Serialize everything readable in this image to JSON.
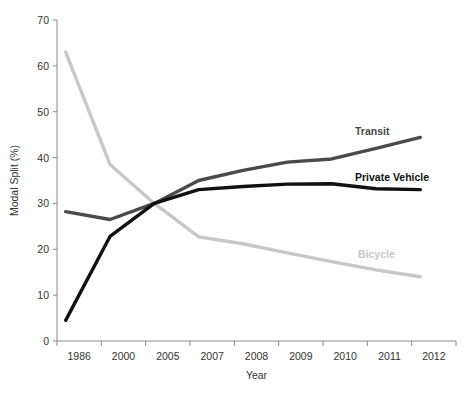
{
  "chart_data": {
    "type": "line",
    "title": "",
    "xlabel": "Year",
    "ylabel": "Modal Split (%)",
    "categories": [
      "1986",
      "2000",
      "2005",
      "2007",
      "2008",
      "2009",
      "2010",
      "2011",
      "2012"
    ],
    "ylim": [
      0,
      70
    ],
    "yticks": [
      0,
      10,
      20,
      30,
      40,
      50,
      60,
      70
    ],
    "grid": false,
    "legend_position": "inline-right",
    "series": [
      {
        "name": "Transit",
        "color": "#4a4a4a",
        "values": [
          28.2,
          26.5,
          30.0,
          35.0,
          37.2,
          39.0,
          39.7,
          42.0,
          44.4
        ]
      },
      {
        "name": "Private Vehicle",
        "color": "#111111",
        "values": [
          4.5,
          22.8,
          30.0,
          33.0,
          33.7,
          34.2,
          34.3,
          33.2,
          33.0
        ]
      },
      {
        "name": "Bicycle",
        "color": "#c8c8c8",
        "values": [
          63.0,
          38.5,
          30.0,
          22.7,
          21.2,
          19.2,
          17.3,
          15.5,
          14.0
        ]
      }
    ]
  }
}
